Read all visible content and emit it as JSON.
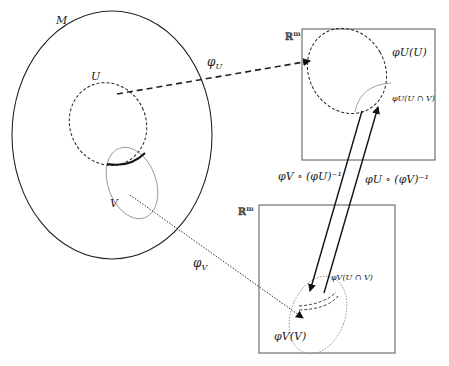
{
  "diagram": {
    "manifold_label": "M",
    "open_set_u_label": "U",
    "open_set_v_label": "V",
    "chart_u_label": "φ",
    "chart_u_sub": "U",
    "chart_v_label": "φ",
    "chart_v_sub": "V",
    "space_top_label": "ℝ",
    "space_top_sup": "m",
    "space_bottom_label": "ℝ",
    "space_bottom_sup": "m",
    "image_u_label": "φU(U)",
    "image_v_label": "φV(V)",
    "image_u_intersection_label": "φU(U ∩ V)",
    "image_v_intersection_label": "φV(U ∩ V)",
    "transition_vu_label": "φV ∘ (φU)⁻¹",
    "transition_uv_label": "φU ∘ (φV)⁻¹"
  },
  "colors": {
    "stroke_dark": "#222222",
    "stroke_light": "#888888",
    "box_stroke": "#555555",
    "background": "#ffffff"
  }
}
